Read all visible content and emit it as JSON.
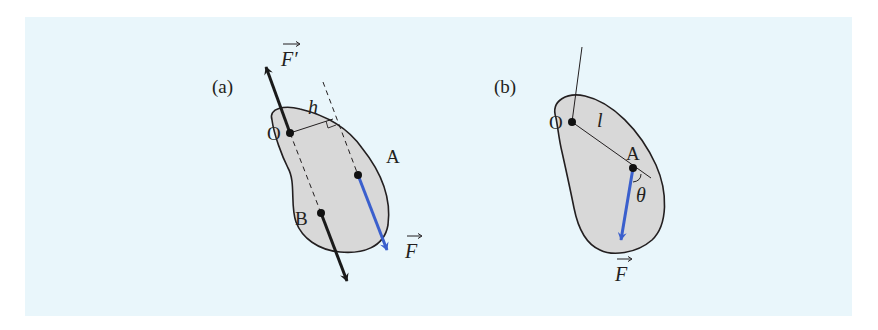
{
  "figure": {
    "background_color": "#e9f6fb",
    "body_fill": "#d8d8d8",
    "outline_color": "#231f20",
    "force_color_blue": "#3a5fcd",
    "force_color_black": "#1a1a1a"
  },
  "panel_a": {
    "label": "(a)",
    "points": {
      "O": "O",
      "A": "A",
      "B": "B"
    },
    "distance_label": "h",
    "forces": {
      "applied": {
        "symbol": "F",
        "vector_arrow": "→",
        "color": "#3a5fcd",
        "at": "A"
      },
      "reaction": {
        "symbol": "F′",
        "vector_arrow": "→",
        "color": "#1a1a1a",
        "at": "O"
      },
      "couple_partner": {
        "color": "#1a1a1a",
        "at": "B"
      }
    }
  },
  "panel_b": {
    "label": "(b)",
    "points": {
      "O": "O",
      "A": "A"
    },
    "distance_label": "l",
    "angle_label": "θ",
    "forces": {
      "applied": {
        "symbol": "F",
        "vector_arrow": "→",
        "color": "#3a5fcd",
        "at": "A"
      }
    }
  }
}
